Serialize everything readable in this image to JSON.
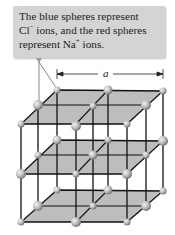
{
  "callout": {
    "line1": "The blue spheres represent",
    "line2_a": "Cl",
    "line2_sup": "−",
    "line2_b": " ions, and the red spheres",
    "line3_a": "represent Na",
    "line3_sup": "+",
    "line3_b": " ions."
  },
  "dimension": {
    "label": "a"
  },
  "colors": {
    "callout_bg": "#d4d4d4",
    "plane_fill": "#bdbdbd",
    "line": "#111111",
    "sphere": "#b8b8b8"
  }
}
